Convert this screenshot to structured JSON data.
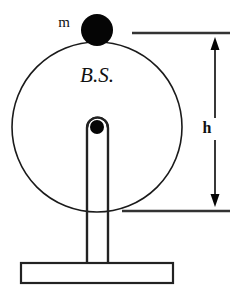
{
  "figure": {
    "background_color": "#ffffff",
    "ink_color": "#111111",
    "width": 237,
    "height": 295
  },
  "labels": {
    "mass_label": "m",
    "disc_label": "B.S.",
    "height_label": "h"
  },
  "elements": {
    "disc": {
      "name": "disc-outline",
      "center_x": 97,
      "center_y": 127,
      "radius": 85,
      "stroke_color": "#1a1a1a"
    },
    "mass_dot": {
      "name": "mass-point",
      "center_x": 97,
      "center_y": 30,
      "radius": 16,
      "fill_color": "#050505"
    },
    "pivot_dot": {
      "name": "pivot-point",
      "center_x": 97,
      "center_y": 127,
      "radius": 7,
      "fill_color": "#050505"
    },
    "post": {
      "name": "support-post",
      "left": 87,
      "right": 108,
      "top": 118,
      "bottom": 263,
      "stroke_color": "#222222"
    },
    "base": {
      "name": "base-plate",
      "left": 21,
      "top": 263,
      "right": 173,
      "bottom": 283,
      "stroke_color": "#222222"
    },
    "extension_line_top": {
      "name": "top-extension-line",
      "x1": 132,
      "x2": 230,
      "y": 33
    },
    "extension_line_bottom": {
      "name": "bottom-extension-line",
      "x1": 122,
      "x2": 230,
      "y": 211
    },
    "dimension_arrow": {
      "name": "height-dimension-arrow",
      "x": 215,
      "y_top": 38,
      "y_bottom": 206,
      "stroke_color": "#222222"
    }
  },
  "label_positions": {
    "mass_label_x": 64,
    "mass_label_y": 27,
    "disc_label_x": 97,
    "disc_label_y": 82,
    "height_label_x": 207,
    "height_label_y": 133
  }
}
